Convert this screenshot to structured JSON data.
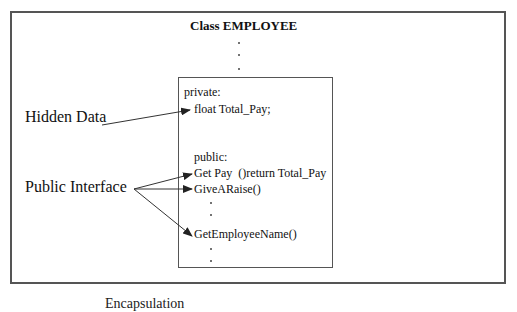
{
  "diagram": {
    "title": "Class EMPLOYEE",
    "private_section": {
      "header": "private:",
      "members": [
        "float Total_Pay;"
      ]
    },
    "public_section": {
      "header": "public:",
      "members": [
        "Get Pay  ()return Total_Pay",
        "GiveARaise()",
        "GetEmployeeName()"
      ]
    },
    "labels": {
      "hidden_data": "Hidden Data",
      "public_interface": "Public Interface"
    },
    "caption": "Encapsulation"
  }
}
